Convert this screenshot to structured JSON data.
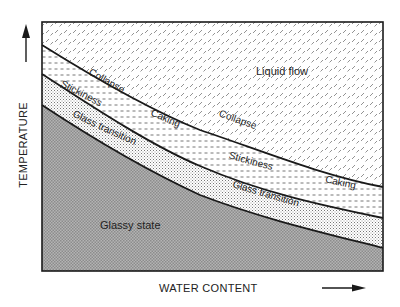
{
  "diagram": {
    "type": "state-diagram",
    "axes": {
      "x_label": "WATER CONTENT",
      "y_label": "TEMPERATURE",
      "x_arrow": "arrow-right",
      "y_arrow": "arrow-up"
    },
    "regions": [
      {
        "id": "liquid-flow",
        "label": "Liquid flow"
      },
      {
        "id": "caking-zone",
        "label": ""
      },
      {
        "id": "sticky-zone",
        "label": ""
      },
      {
        "id": "glassy-state",
        "label": "Glassy state"
      }
    ],
    "curves": {
      "collapse": {
        "labels": [
          "Collapse",
          "Collapse"
        ]
      },
      "caking": {
        "labels": [
          "Caking",
          "Caking"
        ]
      },
      "stickiness": {
        "labels": [
          "Stickiness",
          "Stickiness"
        ]
      },
      "glass_transition": {
        "labels": [
          "Glass transition",
          "Glass transition"
        ]
      }
    },
    "colors": {
      "outline": "#1a1a1a",
      "glassy_fill": "#a8a8a8",
      "background": "#ffffff"
    }
  }
}
